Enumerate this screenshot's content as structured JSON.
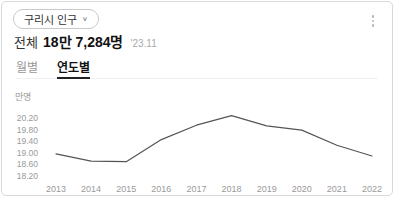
{
  "header": {
    "region_selector_label": "구리시 인구",
    "chevron": "∨",
    "total_label": "전체",
    "total_value": "18만 7,284명",
    "as_of": "'23.11"
  },
  "tabs": [
    {
      "id": "monthly",
      "label": "월별",
      "active": false
    },
    {
      "id": "yearly",
      "label": "연도별",
      "active": true
    }
  ],
  "chart_data": {
    "type": "line",
    "unit_label": "만명",
    "categories": [
      "2013",
      "2014",
      "2015",
      "2016",
      "2017",
      "2018",
      "2019",
      "2020",
      "2021",
      "2022"
    ],
    "values": [
      18.95,
      18.7,
      18.68,
      19.45,
      19.95,
      20.28,
      19.93,
      19.78,
      19.25,
      18.88
    ],
    "ylabel": "만명",
    "xlabel": "",
    "yticks": [
      "20.20",
      "19.80",
      "19.40",
      "19.00",
      "18.60",
      "18.20"
    ],
    "ytick_values": [
      20.2,
      19.8,
      19.4,
      19.0,
      18.6,
      18.2
    ],
    "ylim": [
      18.0,
      20.7
    ],
    "grid": false,
    "legend_position": "none",
    "line_color": "#555555"
  },
  "colors": {
    "card_border": "#d9d9d9",
    "accent_text": "#111111",
    "secondary_text": "#999999"
  }
}
